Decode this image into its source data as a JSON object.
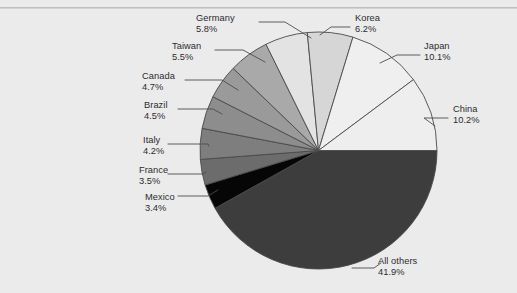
{
  "figure": {
    "background_color": "#ebebec",
    "rule_color": "#b4b6b8",
    "label_color": "#2c2c2e",
    "slice_outline_color": "#4a4a4a"
  },
  "chart_data": {
    "type": "pie",
    "title": "",
    "subtitle": "",
    "xlabel": "",
    "ylabel": "",
    "legend_position": "none",
    "grid": false,
    "labels_style": "outside-with-leader-lines",
    "start_angle_deg": 0,
    "direction": "clockwise",
    "units": "percent",
    "total": 100.0,
    "categories": [
      "All others",
      "China",
      "Japan",
      "Korea",
      "Germany",
      "Taiwan",
      "Canada",
      "Brazil",
      "Italy",
      "France",
      "Mexico"
    ],
    "values": [
      41.9,
      10.2,
      10.1,
      6.2,
      5.8,
      5.5,
      4.7,
      4.5,
      4.2,
      3.5,
      3.4
    ],
    "slices": [
      {
        "name": "All others",
        "value": 41.9,
        "label": "All others",
        "percent_text": "41.9%",
        "color": "#3d3d3e",
        "start_deg": 0.0,
        "end_deg": 150.84
      },
      {
        "name": "Mexico",
        "value": 3.4,
        "label": "Mexico",
        "percent_text": "3.4%",
        "color": "#060607",
        "start_deg": 150.84,
        "end_deg": 163.08
      },
      {
        "name": "France",
        "value": 3.5,
        "label": "France",
        "percent_text": "3.5%",
        "color": "#6c6c6d",
        "start_deg": 163.08,
        "end_deg": 175.68
      },
      {
        "name": "Italy",
        "value": 4.2,
        "label": "Italy",
        "percent_text": "4.2%",
        "color": "#7e7e7f",
        "start_deg": 175.68,
        "end_deg": 190.8
      },
      {
        "name": "Brazil",
        "value": 4.5,
        "label": "Brazil",
        "percent_text": "4.5%",
        "color": "#8d8d8e",
        "start_deg": 190.8,
        "end_deg": 206.98
      },
      {
        "name": "Canada",
        "value": 4.7,
        "label": "Canada",
        "percent_text": "4.7%",
        "color": "#9a9a9b",
        "start_deg": 206.98,
        "end_deg": 223.9
      },
      {
        "name": "Taiwan",
        "value": 5.5,
        "label": "Taiwan",
        "percent_text": "5.5%",
        "color": "#a9a9aa",
        "start_deg": 223.9,
        "end_deg": 243.69
      },
      {
        "name": "Germany",
        "value": 5.8,
        "label": "Germany",
        "percent_text": "5.8%",
        "color": "#e3e3e3",
        "start_deg": 243.69,
        "end_deg": 264.57
      },
      {
        "name": "Korea",
        "value": 6.2,
        "label": "Korea",
        "percent_text": "6.2%",
        "color": "#d6d6d6",
        "start_deg": 264.57,
        "end_deg": 286.89
      },
      {
        "name": "Japan",
        "value": 10.1,
        "label": "Japan",
        "percent_text": "10.1%",
        "color": "#efefef",
        "start_deg": 286.89,
        "end_deg": 323.25
      },
      {
        "name": "China",
        "value": 10.2,
        "label": "China",
        "percent_text": "10.2%",
        "color": "#eeeeee",
        "start_deg": 323.25,
        "end_deg": 360.0
      }
    ]
  },
  "labels": {
    "germany": {
      "name": "Germany",
      "percent": "5.8%"
    },
    "korea": {
      "name": "Korea",
      "percent": "6.2%"
    },
    "japan": {
      "name": "Japan",
      "percent": "10.1%"
    },
    "china": {
      "name": "China",
      "percent": "10.2%"
    },
    "taiwan": {
      "name": "Taiwan",
      "percent": "5.5%"
    },
    "canada": {
      "name": "Canada",
      "percent": "4.7%"
    },
    "brazil": {
      "name": "Brazil",
      "percent": "4.5%"
    },
    "italy": {
      "name": "Italy",
      "percent": "4.2%"
    },
    "france": {
      "name": "France",
      "percent": "3.5%"
    },
    "mexico": {
      "name": "Mexico",
      "percent": "3.4%"
    },
    "allothers": {
      "name": "All others",
      "percent": "41.9%"
    }
  }
}
